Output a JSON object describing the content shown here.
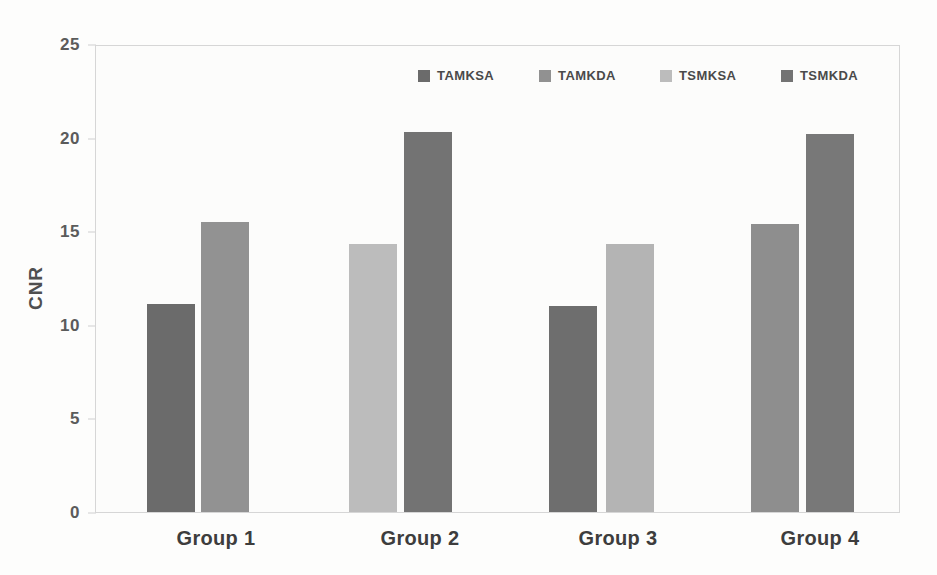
{
  "chart_data": {
    "type": "bar",
    "title": "",
    "subtitle": "",
    "xlabel": "",
    "ylabel": "CNR",
    "categories": [
      "Group 1",
      "Group 2",
      "Group 3",
      "Group 4"
    ],
    "ylim": [
      0,
      25
    ],
    "y_ticks": [
      0,
      5,
      10,
      15,
      20,
      25
    ],
    "y_tick_labels": [
      "0",
      "5",
      "10",
      "15",
      "20",
      "25"
    ],
    "grid": false,
    "legend_position": "top-right",
    "series": [
      {
        "name": "TAMKSA",
        "color": "#6b6b6b",
        "values": [
          11.1,
          null,
          11.0,
          null
        ]
      },
      {
        "name": "TAMKDA",
        "color": "#919191",
        "values": [
          15.5,
          null,
          null,
          15.4
        ]
      },
      {
        "name": "TSMKSA",
        "color": "#bcbcbc",
        "values": [
          null,
          14.3,
          14.3,
          null
        ]
      },
      {
        "name": "TSMKDA",
        "color": "#737373",
        "values": [
          null,
          20.3,
          null,
          20.2
        ]
      }
    ],
    "bars": [
      {
        "group": "Group 1",
        "series": "TAMKSA",
        "value": 11.1,
        "color": "#6b6b6b",
        "x": 146,
        "width": 48
      },
      {
        "group": "Group 1",
        "series": "TAMKDA",
        "value": 15.5,
        "color": "#929292",
        "x": 200,
        "width": 48
      },
      {
        "group": "Group 2",
        "series": "TSMKSA",
        "value": 14.3,
        "color": "#bcbcbc",
        "x": 348,
        "width": 48
      },
      {
        "group": "Group 2",
        "series": "TSMKDA",
        "value": 20.3,
        "color": "#737373",
        "x": 403,
        "width": 48
      },
      {
        "group": "Group 3",
        "series": "TAMKSA",
        "value": 11.0,
        "color": "#6e6e6e",
        "x": 548,
        "width": 48
      },
      {
        "group": "Group 3",
        "series": "TSMKSA",
        "value": 14.3,
        "color": "#b4b4b4",
        "x": 605,
        "width": 48
      },
      {
        "group": "Group 4",
        "series": "TAMKDA",
        "value": 15.4,
        "color": "#8e8e8e",
        "x": 750,
        "width": 48
      },
      {
        "group": "Group 4",
        "series": "TSMKDA",
        "value": 20.2,
        "color": "#787878",
        "x": 805,
        "width": 48
      }
    ],
    "group_label_x": [
      216,
      420,
      618,
      820
    ],
    "legend_entry_x": [
      0,
      121,
      242,
      363
    ]
  }
}
